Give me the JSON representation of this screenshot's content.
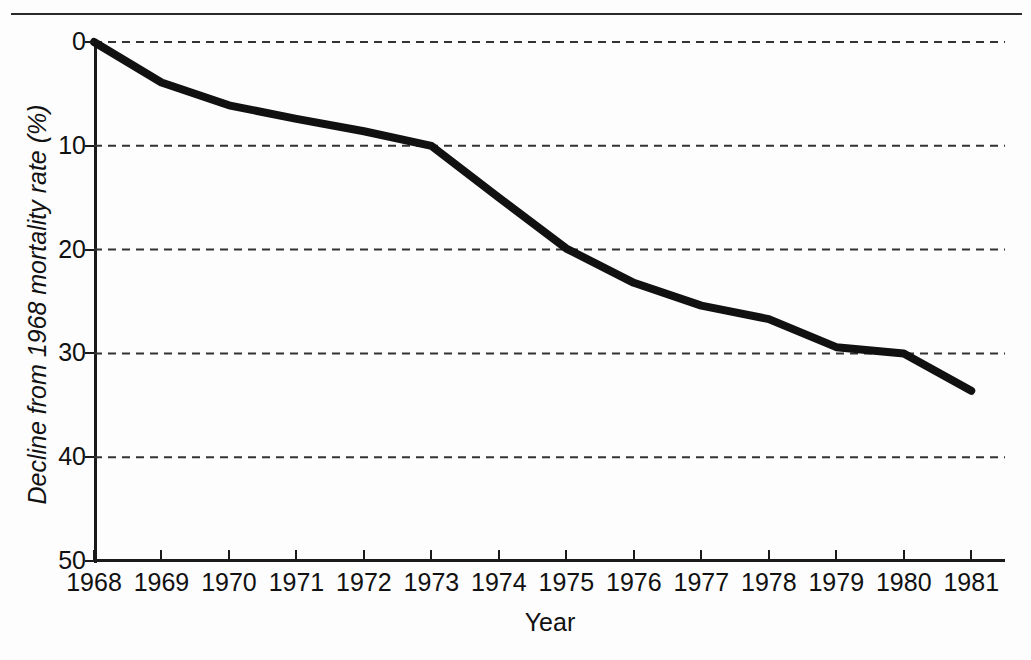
{
  "figure": {
    "background_color": "#fdfdfd",
    "line_color": "#111111",
    "grid_color": "#333333",
    "axis_color": "#1a1a1a"
  },
  "chart_data": {
    "type": "line",
    "title": "",
    "xlabel": "Year",
    "ylabel": "Decline from 1968 mortality rate (%)",
    "categories": [
      "1968",
      "1969",
      "1970",
      "1971",
      "1972",
      "1973",
      "1974",
      "1975",
      "1976",
      "1977",
      "1978",
      "1979",
      "1980",
      "1981"
    ],
    "x": [
      1968,
      1969,
      1970,
      1971,
      1972,
      1973,
      1974,
      1975,
      1976,
      1977,
      1978,
      1979,
      1980,
      1981
    ],
    "values": [
      0.0,
      3.9,
      6.1,
      7.4,
      8.6,
      10.0,
      15.0,
      19.9,
      23.2,
      25.4,
      26.7,
      29.4,
      30.0,
      33.6
    ],
    "series": [
      {
        "name": "Decline from 1968 mortality rate",
        "values": [
          0.0,
          3.9,
          6.1,
          7.4,
          8.6,
          10.0,
          15.0,
          19.9,
          23.2,
          25.4,
          26.7,
          29.4,
          30.0,
          33.6
        ]
      }
    ],
    "xlim": [
      1968,
      1981.5
    ],
    "ylim": [
      0,
      50
    ],
    "y_inverted": true,
    "yticks": [
      0,
      10,
      20,
      30,
      40,
      50
    ],
    "ytick_labels": [
      "0",
      "10",
      "20",
      "30",
      "40",
      "50"
    ],
    "xtick_labels": [
      "1968",
      "1969",
      "1970",
      "1971",
      "1972",
      "1973",
      "1974",
      "1975",
      "1976",
      "1977",
      "1978",
      "1979",
      "1980",
      "1981"
    ],
    "grid": "horizontal-dashed",
    "gridded_values": [
      0,
      10,
      20,
      30,
      40
    ],
    "legend": "none",
    "annotations": []
  }
}
